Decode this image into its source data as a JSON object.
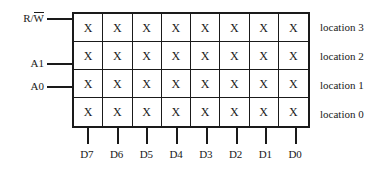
{
  "diagram": {
    "cell_symbol": "X",
    "signal_labels": [
      {
        "id": "rw",
        "prefix": "R/",
        "overbar": "W",
        "top": 12
      },
      {
        "id": "a1",
        "prefix": "A1",
        "overbar": "",
        "top": 57
      },
      {
        "id": "a0",
        "prefix": "A0",
        "overbar": "",
        "top": 80
      }
    ],
    "rows": [
      {
        "label": "location 3",
        "cells": [
          "X",
          "X",
          "X",
          "X",
          "X",
          "X",
          "X",
          "X"
        ]
      },
      {
        "label": "location 2",
        "cells": [
          "X",
          "X",
          "X",
          "X",
          "X",
          "X",
          "X",
          "X"
        ]
      },
      {
        "label": "location 1",
        "cells": [
          "X",
          "X",
          "X",
          "X",
          "X",
          "X",
          "X",
          "X"
        ]
      },
      {
        "label": "location 0",
        "cells": [
          "X",
          "X",
          "X",
          "X",
          "X",
          "X",
          "X",
          "X"
        ]
      }
    ],
    "data_lines": [
      "D7",
      "D6",
      "D5",
      "D4",
      "D3",
      "D2",
      "D1",
      "D0"
    ],
    "colors": {
      "ink": "#1a1a1a",
      "background": "#ffffff"
    }
  }
}
